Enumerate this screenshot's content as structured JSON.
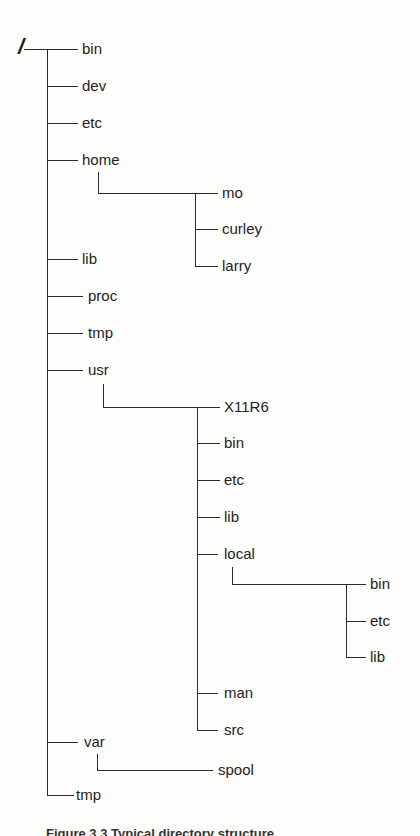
{
  "diagram": {
    "type": "directory-tree",
    "root": {
      "label": "/",
      "x": 18,
      "y": 36
    },
    "caption": "Figure 3.3  Typical directory structure",
    "line_color": "#2a2a2a",
    "nodes": [
      {
        "id": "bin",
        "label": "bin",
        "x": 82,
        "y": 49
      },
      {
        "id": "dev",
        "label": "dev",
        "x": 82,
        "y": 86
      },
      {
        "id": "etc",
        "label": "etc",
        "x": 82,
        "y": 123
      },
      {
        "id": "home",
        "label": "home",
        "x": 82,
        "y": 160
      },
      {
        "id": "home-mo",
        "label": "mo",
        "x": 222,
        "y": 193
      },
      {
        "id": "home-curley",
        "label": "curley",
        "x": 222,
        "y": 229
      },
      {
        "id": "home-larry",
        "label": "larry",
        "x": 222,
        "y": 266
      },
      {
        "id": "lib",
        "label": "lib",
        "x": 82,
        "y": 259
      },
      {
        "id": "proc",
        "label": "proc",
        "x": 88,
        "y": 296
      },
      {
        "id": "tmp",
        "label": "tmp",
        "x": 88,
        "y": 333
      },
      {
        "id": "usr",
        "label": "usr",
        "x": 88,
        "y": 370
      },
      {
        "id": "usr-x11r6",
        "label": "X11R6",
        "x": 224,
        "y": 407
      },
      {
        "id": "usr-bin",
        "label": "bin",
        "x": 224,
        "y": 443
      },
      {
        "id": "usr-etc",
        "label": "etc",
        "x": 224,
        "y": 480
      },
      {
        "id": "usr-lib",
        "label": "lib",
        "x": 224,
        "y": 517
      },
      {
        "id": "usr-local",
        "label": "local",
        "x": 224,
        "y": 554
      },
      {
        "id": "usr-local-bin",
        "label": "bin",
        "x": 370,
        "y": 584
      },
      {
        "id": "usr-local-etc",
        "label": "etc",
        "x": 370,
        "y": 621
      },
      {
        "id": "usr-local-lib",
        "label": "lib",
        "x": 370,
        "y": 657
      },
      {
        "id": "usr-man",
        "label": "man",
        "x": 224,
        "y": 693
      },
      {
        "id": "usr-src",
        "label": "src",
        "x": 224,
        "y": 730
      },
      {
        "id": "var",
        "label": "var",
        "x": 84,
        "y": 742
      },
      {
        "id": "var-spool",
        "label": "spool",
        "x": 218,
        "y": 770
      },
      {
        "id": "tmp2",
        "label": "tmp",
        "x": 76,
        "y": 795
      }
    ],
    "lines": [
      {
        "t": "h",
        "x": 24,
        "y": 49,
        "len": 54
      },
      {
        "t": "v",
        "x": 47,
        "y": 49,
        "len": 746
      },
      {
        "t": "h",
        "x": 47,
        "y": 86,
        "len": 31
      },
      {
        "t": "h",
        "x": 47,
        "y": 123,
        "len": 31
      },
      {
        "t": "h",
        "x": 47,
        "y": 160,
        "len": 31
      },
      {
        "t": "v",
        "x": 98,
        "y": 172,
        "len": 21
      },
      {
        "t": "h",
        "x": 98,
        "y": 193,
        "len": 120
      },
      {
        "t": "v",
        "x": 195,
        "y": 193,
        "len": 73
      },
      {
        "t": "h",
        "x": 195,
        "y": 229,
        "len": 23
      },
      {
        "t": "h",
        "x": 195,
        "y": 266,
        "len": 23
      },
      {
        "t": "h",
        "x": 47,
        "y": 259,
        "len": 31
      },
      {
        "t": "h",
        "x": 47,
        "y": 296,
        "len": 36
      },
      {
        "t": "h",
        "x": 47,
        "y": 333,
        "len": 36
      },
      {
        "t": "h",
        "x": 47,
        "y": 370,
        "len": 36
      },
      {
        "t": "v",
        "x": 103,
        "y": 384,
        "len": 23
      },
      {
        "t": "h",
        "x": 103,
        "y": 407,
        "len": 117
      },
      {
        "t": "v",
        "x": 197,
        "y": 407,
        "len": 323
      },
      {
        "t": "h",
        "x": 197,
        "y": 443,
        "len": 23
      },
      {
        "t": "h",
        "x": 197,
        "y": 480,
        "len": 23
      },
      {
        "t": "h",
        "x": 197,
        "y": 517,
        "len": 23
      },
      {
        "t": "h",
        "x": 197,
        "y": 554,
        "len": 21
      },
      {
        "t": "v",
        "x": 232,
        "y": 567,
        "len": 17
      },
      {
        "t": "h",
        "x": 232,
        "y": 584,
        "len": 134
      },
      {
        "t": "v",
        "x": 346,
        "y": 584,
        "len": 73
      },
      {
        "t": "h",
        "x": 346,
        "y": 621,
        "len": 20
      },
      {
        "t": "h",
        "x": 346,
        "y": 657,
        "len": 20
      },
      {
        "t": "h",
        "x": 197,
        "y": 693,
        "len": 21
      },
      {
        "t": "h",
        "x": 197,
        "y": 730,
        "len": 21
      },
      {
        "t": "h",
        "x": 47,
        "y": 742,
        "len": 31
      },
      {
        "t": "v",
        "x": 97,
        "y": 754,
        "len": 16
      },
      {
        "t": "h",
        "x": 97,
        "y": 770,
        "len": 116
      },
      {
        "t": "h",
        "x": 47,
        "y": 795,
        "len": 27
      }
    ]
  }
}
